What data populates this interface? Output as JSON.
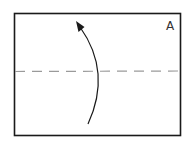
{
  "diagram": {
    "type": "fold-instruction",
    "corner_label": "A",
    "fold_line": {
      "style": "dashed",
      "orientation": "horizontal",
      "position": "middle"
    },
    "arrow": {
      "direction": "up",
      "meaning": "fold bottom half up along the dashed line"
    },
    "colors": {
      "border": "#1a1a1a",
      "fold_line": "#9a9a9a",
      "arrow": "#1a1a1a",
      "background": "#ffffff"
    }
  }
}
